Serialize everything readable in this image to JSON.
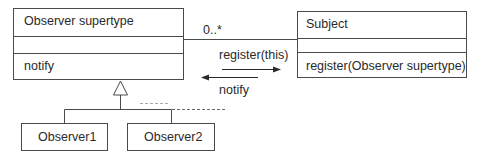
{
  "diagram": {
    "type": "uml-class-diagram",
    "classes": [
      {
        "id": "observer_supertype",
        "name": "Observer  supertype",
        "attributes": "",
        "operations": "notify"
      },
      {
        "id": "subject",
        "name": "Subject",
        "attributes": "",
        "operations": "register(Observer supertype)"
      },
      {
        "id": "observer1",
        "name": "Observer1"
      },
      {
        "id": "observer2",
        "name": "Observer2"
      }
    ],
    "association": {
      "from": "subject",
      "to": "observer_supertype",
      "multiplicity": "0..*"
    },
    "messages": [
      {
        "label": "register(this)",
        "direction": "right"
      },
      {
        "label": "notify",
        "direction": "left"
      }
    ],
    "generalization": {
      "parent": "observer_supertype",
      "children": [
        "observer1",
        "observer2"
      ]
    },
    "colors": {
      "line": "#4a4a4a",
      "text": "#2a2a2a",
      "dashed": "#8a8a8a",
      "background": "#ffffff"
    }
  }
}
